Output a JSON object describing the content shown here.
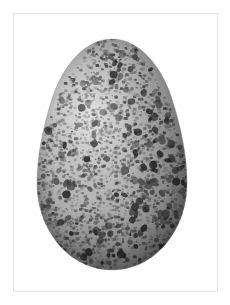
{
  "image": {
    "subject": "speckled egg",
    "caption": "",
    "background_color": "#ffffff",
    "frame": {
      "color": "#e6e6e6",
      "x": 13,
      "y": 13,
      "width": 205,
      "height": 279
    },
    "canvas": {
      "width": 230,
      "height": 305
    }
  },
  "egg": {
    "label": "egg",
    "shape": "ovoid",
    "bounds": {
      "x": 34,
      "y": 38,
      "width": 156,
      "height": 234
    },
    "base_color": "#a9a9a9",
    "highlight_color": "#c9c9c9",
    "shadow_color": "#7a7a7a",
    "edge_color": "#6d6d6d",
    "speckle_color_dark": "#262626",
    "speckle_color_mid": "#4d4d4d",
    "speckle_color_light": "#6f6f6f",
    "speckle_density": "very high",
    "highlight_position": "upper-left-of-center",
    "shadow_position": "right-and-lower-right"
  },
  "speckles": {
    "seed": 20240517,
    "count_fine": 2600,
    "count_blotch": 210,
    "fine_radius_min": 0.55,
    "fine_radius_max": 1.9,
    "blotch_radius_min": 1.6,
    "blotch_radius_max": 4.2
  }
}
